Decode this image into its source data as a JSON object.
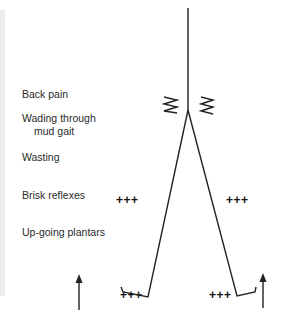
{
  "labels": {
    "back_pain": "Back pain",
    "wading_line1": "Wading through",
    "wading_line2": "mud gait",
    "wasting": "Wasting",
    "brisk_reflexes": "Brisk reflexes",
    "upgoing_plantars": "Up-going plantars"
  },
  "reflex_marks": {
    "left_knee": "+++",
    "right_knee": "+++",
    "left_ankle": "+++",
    "right_ankle": "+++"
  },
  "icons": [
    "spine-line",
    "pain-squiggle-left",
    "pain-squiggle-right",
    "left-leg-line",
    "right-leg-line",
    "up-arrow-left",
    "up-arrow-right"
  ],
  "colors": {
    "line": "#222222",
    "text": "#2a2a2a",
    "strip": "#ececec"
  }
}
